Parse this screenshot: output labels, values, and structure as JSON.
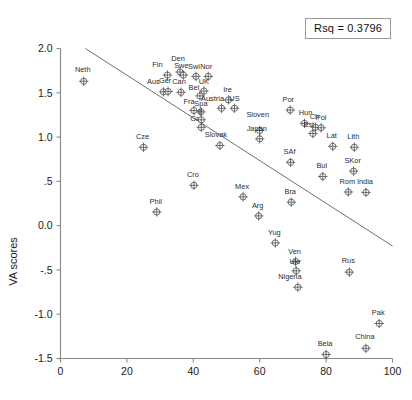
{
  "chart_data": {
    "type": "scatter",
    "title": "",
    "xlabel": "",
    "ylabel": "VA scores",
    "xlim": [
      0,
      100
    ],
    "ylim": [
      -1.5,
      2.0
    ],
    "xticks": [
      0,
      20,
      40,
      60,
      80,
      100
    ],
    "xticklabels": [
      "0",
      "20",
      "40",
      "60",
      "80",
      "100"
    ],
    "yticks": [
      -1.5,
      -1.0,
      -0.5,
      0.0,
      0.5,
      1.0,
      1.5,
      2.0
    ],
    "yticklabels": [
      "-1.5",
      "-1.0",
      "-.5",
      "0.0",
      ".5",
      "1.0",
      "1.5",
      "2.0"
    ],
    "grid": false,
    "legend": "none",
    "annotation": {
      "text": "Rsq = 0.3796",
      "position": "top-right"
    },
    "fit_line": {
      "type": "linear-regression",
      "x_start": 7.5,
      "y_start": 2.0,
      "x_end": 100,
      "y_end": -0.23
    },
    "points": [
      {
        "label": "Neth",
        "x": 7,
        "y": 1.63,
        "label_dx": -1,
        "label_dy": -7
      },
      {
        "label": "Fin",
        "x": 32.2,
        "y": 1.7,
        "label_dx": -10,
        "label_dy": -6
      },
      {
        "label": "Den",
        "x": 36.0,
        "y": 1.735,
        "label_dx": -2,
        "label_dy": -9
      },
      {
        "label": "Swe",
        "x": 37.0,
        "y": 1.7,
        "label_dx": -2,
        "label_dy": -5
      },
      {
        "label": "Swi",
        "x": 40.8,
        "y": 1.685,
        "label_dx": -2,
        "label_dy": -5
      },
      {
        "label": "Nor",
        "x": 44.5,
        "y": 1.685,
        "label_dx": -2,
        "label_dy": -5
      },
      {
        "label": "Aus",
        "x": 31.0,
        "y": 1.51,
        "label_dx": -10,
        "label_dy": -6
      },
      {
        "label": "Ger",
        "x": 32.4,
        "y": 1.515,
        "label_dx": -3,
        "label_dy": -6
      },
      {
        "label": "Can",
        "x": 36.3,
        "y": 1.505,
        "label_dx": -2,
        "label_dy": -6
      },
      {
        "label": "UK",
        "x": 43.2,
        "y": 1.52,
        "label_dx": 0,
        "label_dy": -5
      },
      {
        "label": "Bel",
        "x": 42.0,
        "y": 1.465,
        "label_dx": -6,
        "label_dy": -4
      },
      {
        "label": "Ire",
        "x": 50.6,
        "y": 1.42,
        "label_dx": -1,
        "label_dy": -6
      },
      {
        "label": "Austria",
        "x": 48.5,
        "y": 1.325,
        "label_dx": -9,
        "label_dy": -5
      },
      {
        "label": "US",
        "x": 52.4,
        "y": 1.325,
        "label_dx": 0,
        "label_dy": -5
      },
      {
        "label": "Fra",
        "x": 40.2,
        "y": 1.3,
        "label_dx": -5,
        "label_dy": -5
      },
      {
        "label": "Spa",
        "x": 42.3,
        "y": 1.285,
        "label_dx": 0,
        "label_dy": -4
      },
      {
        "label": "It",
        "x": 42.4,
        "y": 1.195,
        "label_dx": -1,
        "label_dy": -4
      },
      {
        "label": "Gr",
        "x": 42.4,
        "y": 1.11,
        "label_dx": -7,
        "label_dy": -4
      },
      {
        "label": "Por",
        "x": 69.2,
        "y": 1.305,
        "label_dx": -2,
        "label_dy": -6
      },
      {
        "label": "Hun",
        "x": 73.5,
        "y": 1.155,
        "label_dx": 1,
        "label_dy": -6
      },
      {
        "label": "Ch",
        "x": 76.8,
        "y": 1.11,
        "label_dx": -1,
        "label_dy": -6
      },
      {
        "label": "Pol",
        "x": 78.5,
        "y": 1.105,
        "label_dx": 0,
        "label_dy": -6
      },
      {
        "label": "Est",
        "x": 76.0,
        "y": 1.04,
        "label_dx": -4,
        "label_dy": -5
      },
      {
        "label": "Lat",
        "x": 82.0,
        "y": 0.895,
        "label_dx": -1,
        "label_dy": -6
      },
      {
        "label": "Lith",
        "x": 88.5,
        "y": 0.885,
        "label_dx": -1,
        "label_dy": -6
      },
      {
        "label": "Sloven",
        "x": 60.0,
        "y": 1.075,
        "label_dx": -2,
        "label_dy": -11
      },
      {
        "label": "Japan",
        "x": 60.0,
        "y": 0.98,
        "label_dx": -3,
        "label_dy": -6
      },
      {
        "label": "Slovak",
        "x": 48.0,
        "y": 0.905,
        "label_dx": -4,
        "label_dy": -6
      },
      {
        "label": "Cze",
        "x": 25.0,
        "y": 0.885,
        "label_dx": -1,
        "label_dy": -6
      },
      {
        "label": "SAf",
        "x": 69.3,
        "y": 0.715,
        "label_dx": -1,
        "label_dy": -6
      },
      {
        "label": "Bul",
        "x": 79.0,
        "y": 0.555,
        "label_dx": -1,
        "label_dy": -6
      },
      {
        "label": "SKor",
        "x": 88.3,
        "y": 0.615,
        "label_dx": -1,
        "label_dy": -6
      },
      {
        "label": "Rom",
        "x": 86.7,
        "y": 0.38,
        "label_dx": -1,
        "label_dy": -6
      },
      {
        "label": "India",
        "x": 92.0,
        "y": 0.375,
        "label_dx": -1,
        "label_dy": -6
      },
      {
        "label": "Cro",
        "x": 40.2,
        "y": 0.455,
        "label_dx": -1,
        "label_dy": -6
      },
      {
        "label": "Mex",
        "x": 55.0,
        "y": 0.325,
        "label_dx": -1,
        "label_dy": -6
      },
      {
        "label": "Bra",
        "x": 69.5,
        "y": 0.265,
        "label_dx": -1,
        "label_dy": -6
      },
      {
        "label": "Arg",
        "x": 59.7,
        "y": 0.11,
        "label_dx": -1,
        "label_dy": -6
      },
      {
        "label": "Phil",
        "x": 29.0,
        "y": 0.155,
        "label_dx": -1,
        "label_dy": -6
      },
      {
        "label": "Yug",
        "x": 64.7,
        "y": -0.195,
        "label_dx": -1,
        "label_dy": -6
      },
      {
        "label": "Ven",
        "x": 70.8,
        "y": -0.405,
        "label_dx": -1,
        "label_dy": -6
      },
      {
        "label": "Ukr",
        "x": 71.0,
        "y": -0.51,
        "label_dx": -1,
        "label_dy": -5
      },
      {
        "label": "Nigeria",
        "x": 71.5,
        "y": -0.695,
        "label_dx": -8,
        "label_dy": -6
      },
      {
        "label": "Rus",
        "x": 87.0,
        "y": -0.525,
        "label_dx": -1,
        "label_dy": -7
      },
      {
        "label": "Pak",
        "x": 96.0,
        "y": -1.105,
        "label_dx": -1,
        "label_dy": -7
      },
      {
        "label": "China",
        "x": 92.0,
        "y": -1.385,
        "label_dx": -1,
        "label_dy": -7
      },
      {
        "label": "Bela",
        "x": 80.0,
        "y": -1.455,
        "label_dx": -1,
        "label_dy": -7
      }
    ]
  },
  "colors": {
    "axis": "#888888",
    "marker_stroke": "#555555",
    "marker_fill": "#ffffff",
    "fit_line": "#6f6f6f",
    "text": "#1a1a1a",
    "background": "#ffffff"
  }
}
